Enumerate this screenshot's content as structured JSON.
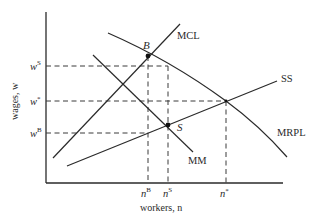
{
  "diagram": {
    "type": "labor-market-diagram",
    "axes": {
      "x_label": "workers, n",
      "y_label": "wages, w"
    },
    "curves": [
      {
        "id": "MCL",
        "label": "MCL"
      },
      {
        "id": "SS",
        "label": "SS"
      },
      {
        "id": "MRPL",
        "label": "MRPL"
      },
      {
        "id": "MM",
        "label": "MM"
      }
    ],
    "points": [
      {
        "id": "B",
        "label": "B"
      },
      {
        "id": "S",
        "label": "S"
      }
    ],
    "y_ticks": [
      {
        "base": "w",
        "sup": "S"
      },
      {
        "base": "w",
        "sup": "*"
      },
      {
        "base": "w",
        "sup": "B"
      }
    ],
    "x_ticks": [
      {
        "base": "n",
        "sup": "B"
      },
      {
        "base": "n",
        "sup": "S"
      },
      {
        "base": "n",
        "sup": "*"
      }
    ]
  }
}
